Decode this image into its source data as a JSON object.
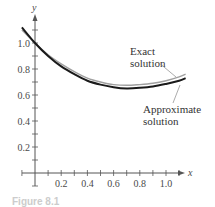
{
  "chart_data": {
    "type": "line",
    "title": "",
    "xlabel": "x",
    "ylabel": "y",
    "xlim": [
      -0.1,
      1.15
    ],
    "ylim": [
      -0.1,
      1.2
    ],
    "grid": false,
    "x_ticks": [
      0.2,
      0.4,
      0.6,
      0.8,
      1.0
    ],
    "x_tick_labels": [
      "0.2",
      "0.4",
      "0.6",
      "0.8",
      "1.0"
    ],
    "x_minor_step": 0.1,
    "y_ticks": [
      0.2,
      0.4,
      0.6,
      0.8,
      1.0
    ],
    "y_tick_labels": [
      "0.2",
      "0.4",
      "0.6",
      "0.8",
      "1.0"
    ],
    "y_minor_step": 0.1,
    "x": [
      -0.1,
      0.0,
      0.1,
      0.2,
      0.3,
      0.4,
      0.5,
      0.6,
      0.7,
      0.8,
      0.9,
      1.0,
      1.1,
      1.15
    ],
    "series": [
      {
        "name": "Exact solution",
        "color": "#a0a0a0",
        "values": [
          1.1,
          1.0,
          0.91,
          0.84,
          0.78,
          0.73,
          0.7,
          0.68,
          0.675,
          0.68,
          0.69,
          0.71,
          0.74,
          0.76
        ]
      },
      {
        "name": "Approximate solution",
        "color": "#1a1a1a",
        "values": [
          1.12,
          1.0,
          0.9,
          0.82,
          0.76,
          0.71,
          0.68,
          0.66,
          0.65,
          0.655,
          0.665,
          0.685,
          0.71,
          0.73
        ]
      }
    ],
    "annotations": [
      {
        "text_lines": [
          "Exact",
          "solution"
        ],
        "target_series": "Exact solution"
      },
      {
        "text_lines": [
          "Approximate",
          "solution"
        ],
        "target_series": "Approximate solution"
      }
    ],
    "legend": "none (inline annotations)"
  },
  "caption": "Figure 8.1"
}
